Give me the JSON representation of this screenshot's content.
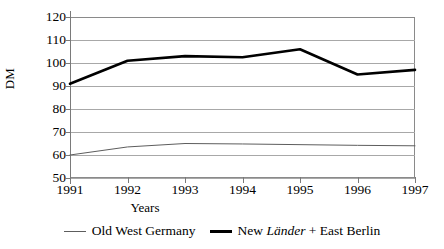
{
  "chart_data": {
    "type": "line",
    "title": "",
    "xlabel": "Years",
    "ylabel": "DM",
    "categories": [
      "1991",
      "1992",
      "1993",
      "1994",
      "1995",
      "1996",
      "1997"
    ],
    "x": [
      1991,
      1992,
      1993,
      1994,
      1995,
      1996,
      1997
    ],
    "xlim": [
      1991,
      1997
    ],
    "ylim": [
      50,
      120
    ],
    "y_ticks": [
      50,
      60,
      70,
      80,
      90,
      100,
      110,
      120
    ],
    "grid": true,
    "legend_position": "bottom",
    "series": [
      {
        "name": "Old West Germany",
        "values": [
          60,
          63.5,
          65,
          64.8,
          64.5,
          64.2,
          64
        ],
        "style": "thin",
        "color": "#5d5d5d"
      },
      {
        "name": "New Länder + East Berlin",
        "values": [
          91,
          101,
          103,
          102.5,
          106,
          95,
          97
        ],
        "style": "bold",
        "color": "#000000"
      }
    ]
  },
  "legend": {
    "items": [
      {
        "label_plain": "Old West Germany",
        "marker": "thin-line-swatch"
      },
      {
        "label_html": "New Länder + East Berlin",
        "marker": "bold-line-swatch"
      }
    ],
    "item2_prefix": "New ",
    "item2_italic": "Länder",
    "item2_suffix": " + East Berlin"
  },
  "axes": {
    "y_title": "DM",
    "x_title": "Years",
    "y_tick_labels": [
      "120",
      "110",
      "100",
      "90",
      "80",
      "70",
      "60",
      "50"
    ],
    "x_tick_labels": [
      "1991",
      "1992",
      "1993",
      "1994",
      "1995",
      "1996",
      "1997"
    ]
  },
  "colors": {
    "series_bold": "#000000",
    "series_thin": "#5d5d5d",
    "gridline": "#a8a8a8",
    "axis": "#7a7a7a",
    "background": "#ffffff"
  }
}
